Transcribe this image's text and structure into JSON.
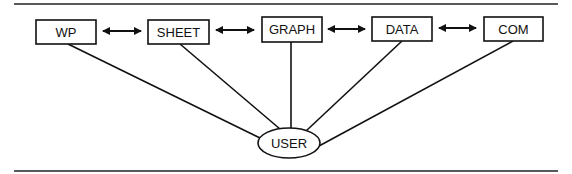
{
  "diagram": {
    "nodes": [
      {
        "id": "wp",
        "label": "WP",
        "x": 36,
        "y": 20,
        "w": 60,
        "h": 24
      },
      {
        "id": "sheet",
        "label": "SHEET",
        "x": 148,
        "y": 20,
        "w": 61,
        "h": 24
      },
      {
        "id": "graph",
        "label": "GRAPH",
        "x": 262,
        "y": 17,
        "w": 60,
        "h": 25
      },
      {
        "id": "data",
        "label": "DATA",
        "x": 372,
        "y": 17,
        "w": 60,
        "h": 24
      },
      {
        "id": "com",
        "label": "COM",
        "x": 484,
        "y": 17,
        "w": 59,
        "h": 24
      }
    ],
    "user": {
      "label": "USER",
      "cx": 289,
      "cy": 143,
      "rx": 31,
      "ry": 15
    },
    "bidirectional_arrows": [
      {
        "from": "wp",
        "to": "sheet"
      },
      {
        "from": "sheet",
        "to": "graph"
      },
      {
        "from": "graph",
        "to": "data"
      },
      {
        "from": "data",
        "to": "com"
      }
    ],
    "user_links": [
      "wp",
      "sheet",
      "graph",
      "data",
      "com"
    ],
    "line_color": "#111111"
  }
}
